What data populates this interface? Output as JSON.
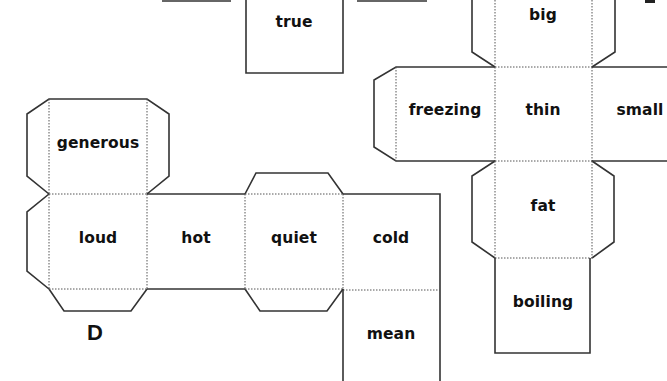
{
  "diagram": {
    "type": "cube-nets-worksheet",
    "colors": {
      "line": "#333333",
      "text": "#111111",
      "background": "#ffffff"
    },
    "nets": [
      {
        "id": "top-center-partial",
        "faces": [
          {
            "label": "true"
          }
        ]
      },
      {
        "id": "D",
        "letter": "D",
        "faces": [
          {
            "label": "generous"
          },
          {
            "label": "loud"
          },
          {
            "label": "hot"
          },
          {
            "label": "quiet"
          },
          {
            "label": "cold"
          },
          {
            "label": "mean"
          }
        ]
      },
      {
        "id": "right-net",
        "faces": [
          {
            "label": "big"
          },
          {
            "label": "freezing"
          },
          {
            "label": "thin"
          },
          {
            "label": "small"
          },
          {
            "label": "fat"
          },
          {
            "label": "boiling"
          }
        ]
      }
    ]
  }
}
